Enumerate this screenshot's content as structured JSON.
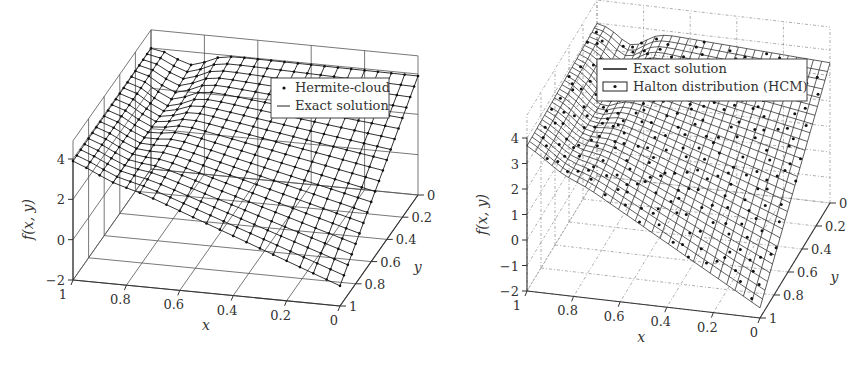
{
  "chart_data": [
    {
      "type": "surface3d",
      "title": "",
      "xlabel": "x",
      "ylabel": "y",
      "zlabel": "f(x, y)",
      "x_ticks": [
        "1",
        "0.8",
        "0.6",
        "0.4",
        "0.2",
        "0"
      ],
      "y_ticks": [
        "0",
        "0.2",
        "0.4",
        "0.6",
        "0.8",
        "1"
      ],
      "z_ticks": [
        "4",
        "2",
        "0",
        "−2"
      ],
      "xlim": [
        0,
        1
      ],
      "ylim": [
        0,
        1
      ],
      "zlim": [
        -2,
        4
      ],
      "grid": "solid",
      "legend": {
        "position": "upper right (back wall)",
        "entries": [
          {
            "label": "Hermite-cloud",
            "marker": "dot"
          },
          {
            "label": "Exact solution",
            "marker": "line"
          }
        ]
      },
      "surface": {
        "description": "Surface ≈4 along y=0 and at x=1, decreasing toward (x=0, y=1) where f ≈ −1; mesh 20×20 with nodal dots",
        "corners": {
          "x1_y0": 4,
          "x0_y0": 3.9,
          "x1_y1": 3.9,
          "x0_y1": -1.0
        }
      },
      "layout": {
        "zaxis_x": 73,
        "z_ticks_y": [
          157,
          197,
          237,
          278
        ],
        "x_axis": {
          "from": [
            73,
            280
          ],
          "to": [
            340,
            306
          ]
        },
        "y_axis": {
          "from": [
            340,
            306
          ],
          "to": [
            418,
            195
          ]
        },
        "back_top": [
          152,
          37
        ]
      }
    },
    {
      "type": "surface3d",
      "title": "",
      "xlabel": "x",
      "ylabel": "y",
      "zlabel": "f(x, y)",
      "x_ticks": [
        "1",
        "0.8",
        "0.6",
        "0.4",
        "0.2",
        "0"
      ],
      "y_ticks": [
        "0",
        "0.2",
        "0.4",
        "0.6",
        "0.8",
        "1"
      ],
      "z_ticks": [
        "4",
        "3",
        "2",
        "1",
        "0",
        "−1",
        "−2"
      ],
      "xlim": [
        0,
        1
      ],
      "ylim": [
        0,
        1
      ],
      "zlim": [
        -2,
        4
      ],
      "grid": "dotted",
      "legend": {
        "position": "upper (back wall)",
        "entries": [
          {
            "label": "Exact solution",
            "marker": "line"
          },
          {
            "label": "Halton distribution (HCM)",
            "marker": "boxed-dot"
          }
        ]
      },
      "surface": {
        "description": "Same exact solution surface rendered with fine mesh; scattered Halton-distributed collocation points overlaid",
        "corners": {
          "x1_y0": 4,
          "x0_y0": 3.5,
          "x1_y1": 3.7,
          "x0_y1": -1.6
        }
      },
      "layout": {
        "zaxis_x": 527,
        "z_ticks_y": [
          138,
          164,
          189,
          215,
          240,
          266,
          291
        ],
        "x_axis": {
          "from": [
            527,
            291
          ],
          "to": [
            760,
            318
          ]
        },
        "y_axis": {
          "from": [
            760,
            318
          ],
          "to": [
            830,
            203
          ]
        },
        "back_top": [
          593,
          16
        ]
      }
    }
  ]
}
